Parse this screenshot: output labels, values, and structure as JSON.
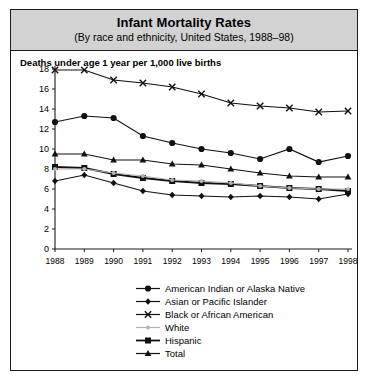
{
  "header": {
    "title": "Infant Mortality Rates",
    "subtitle": "(By race and ethnicity, United States, 1988–98)"
  },
  "axis_note": "Deaths under age 1 year per 1,000 live births",
  "legend": {
    "items": [
      {
        "label": "American Indian or Alaska Native",
        "marker": "circle",
        "color": "#111111"
      },
      {
        "label": "Asian or Pacific Islander",
        "marker": "diamond",
        "color": "#111111"
      },
      {
        "label": "Black or African American",
        "marker": "cross",
        "color": "#111111"
      },
      {
        "label": "White",
        "marker": "circle-small",
        "color": "#b4b4b4"
      },
      {
        "label": "Hispanic",
        "marker": "square",
        "color": "#111111"
      },
      {
        "label": "Total",
        "marker": "triangle",
        "color": "#111111"
      }
    ]
  },
  "chart_data": {
    "type": "line",
    "title": "Infant Mortality Rates",
    "subtitle": "(By race and ethnicity, United States, 1988–98)",
    "xlabel": "",
    "ylabel": "Deaths under age 1 year per 1,000 live births",
    "x": [
      1988,
      1989,
      1990,
      1991,
      1992,
      1993,
      1994,
      1995,
      1996,
      1997,
      1998
    ],
    "xtick_labels": [
      "1988",
      "1989",
      "1990",
      "1991",
      "1992",
      "1993",
      "1994",
      "1995",
      "1996",
      "1997",
      "1998"
    ],
    "ylim": [
      0,
      18
    ],
    "yticks": [
      0,
      2,
      4,
      6,
      8,
      10,
      12,
      14,
      16,
      18
    ],
    "grid": false,
    "legend_position": "bottom",
    "series": [
      {
        "name": "Black or African American",
        "marker": "cross",
        "color": "#111111",
        "values": [
          17.9,
          17.9,
          16.9,
          16.6,
          16.2,
          15.5,
          14.6,
          14.3,
          14.1,
          13.7,
          13.8
        ]
      },
      {
        "name": "American Indian or Alaska Native",
        "marker": "circle",
        "color": "#111111",
        "values": [
          12.7,
          13.3,
          13.1,
          11.3,
          10.6,
          10.0,
          9.6,
          9.0,
          10.0,
          8.7,
          9.3
        ]
      },
      {
        "name": "Total",
        "marker": "triangle",
        "color": "#111111",
        "values": [
          9.5,
          9.5,
          8.9,
          8.9,
          8.5,
          8.4,
          8.0,
          7.6,
          7.3,
          7.2,
          7.2
        ]
      },
      {
        "name": "Hispanic",
        "marker": "square",
        "color": "#111111",
        "values": [
          8.2,
          8.1,
          7.5,
          7.1,
          6.8,
          6.6,
          6.5,
          6.3,
          6.1,
          6.0,
          5.8
        ]
      },
      {
        "name": "White",
        "marker": "circle-small",
        "color": "#b4b4b4",
        "values": [
          8.0,
          8.0,
          7.6,
          7.3,
          6.9,
          6.8,
          6.6,
          6.3,
          6.1,
          6.0,
          6.0
        ]
      },
      {
        "name": "Asian or Pacific Islander",
        "marker": "diamond",
        "color": "#111111",
        "values": [
          6.8,
          7.4,
          6.6,
          5.8,
          5.4,
          5.3,
          5.2,
          5.3,
          5.2,
          5.0,
          5.5
        ]
      }
    ]
  }
}
